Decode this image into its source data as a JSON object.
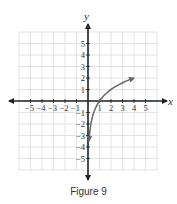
{
  "caption": "Figure 9",
  "chart_data": {
    "type": "line",
    "title": "",
    "xlabel": "x",
    "ylabel": "y",
    "xlim": [
      -6,
      6
    ],
    "ylim": [
      -6,
      6
    ],
    "grid": true,
    "x_ticks": [
      -5,
      -4,
      -3,
      -2,
      -1,
      1,
      2,
      3,
      4,
      5
    ],
    "y_ticks": [
      -5,
      -4,
      -3,
      -2,
      -1,
      1,
      2,
      3,
      4,
      5
    ],
    "series": [
      {
        "name": "y = log2(x)",
        "x": [
          0.09,
          0.125,
          0.25,
          0.5,
          1,
          1.5,
          2,
          2.5,
          3,
          3.5,
          4
        ],
        "y": [
          -3.47,
          -3,
          -2,
          -1,
          0,
          0.58,
          1,
          1.32,
          1.58,
          1.81,
          2
        ],
        "arrows": [
          "start",
          "end"
        ],
        "color": "#666666"
      }
    ],
    "legend": null
  }
}
